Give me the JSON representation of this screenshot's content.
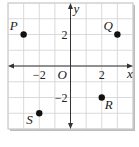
{
  "chart_data": {
    "type": "scatter",
    "title": "",
    "xlabel": "x",
    "ylabel": "y",
    "origin_label": "O",
    "xlim": [
      -4,
      4
    ],
    "ylim": [
      -4,
      4
    ],
    "grid": true,
    "x_tick_labels": [
      {
        "value": -2,
        "label": "−2"
      },
      {
        "value": 2,
        "label": "2"
      }
    ],
    "y_tick_labels": [
      {
        "value": 2,
        "label": "2"
      },
      {
        "value": -2,
        "label": "−2"
      }
    ],
    "points": [
      {
        "name": "P",
        "x": -3,
        "y": 2
      },
      {
        "name": "Q",
        "x": 3,
        "y": 2
      },
      {
        "name": "R",
        "x": 2,
        "y": -2
      },
      {
        "name": "S",
        "x": -2,
        "y": -3
      }
    ]
  },
  "colors": {
    "grid": "#d0d0d0",
    "axis": "#333333",
    "point": "#111111",
    "frame": "#c8c8c8",
    "shadow": "#bdbdbd"
  }
}
